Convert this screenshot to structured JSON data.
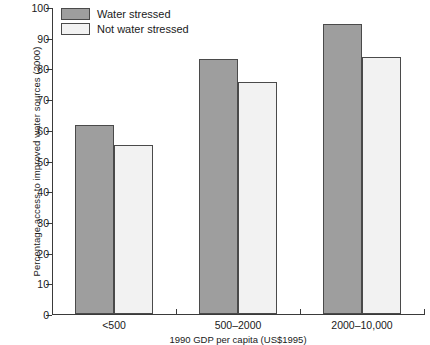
{
  "chart_data": {
    "type": "bar",
    "title": "",
    "xlabel": "1990 GDP per capita (US$1995)",
    "ylabel": "Percentage access to improved water sources (2000)",
    "categories": [
      "<500",
      "500–2000",
      "2000–10,000"
    ],
    "series": [
      {
        "name": "Water stressed",
        "color": "#9e9e9e",
        "values": [
          61.5,
          83.0,
          94.5
        ]
      },
      {
        "name": "Not water stressed",
        "color": "#f2f2f2",
        "values": [
          55.0,
          75.5,
          83.7
        ]
      }
    ],
    "ylim": [
      0,
      100
    ],
    "yticks": [
      0,
      10,
      20,
      30,
      40,
      50,
      60,
      70,
      80,
      90,
      100
    ],
    "ytick_labels": [
      "0",
      "10",
      "20",
      "30",
      "40",
      "50",
      "60",
      "70",
      "80",
      "90",
      "100"
    ],
    "grid": false,
    "legend_position": "top-left"
  },
  "legend": {
    "items": [
      {
        "label": "Water stressed"
      },
      {
        "label": "Not water stressed"
      }
    ]
  },
  "colors": {
    "water_stressed": "#9e9e9e",
    "not_water_stressed": "#f2f2f2",
    "axis": "#3a3a3a",
    "bar_outline": "#4a4a4a"
  }
}
